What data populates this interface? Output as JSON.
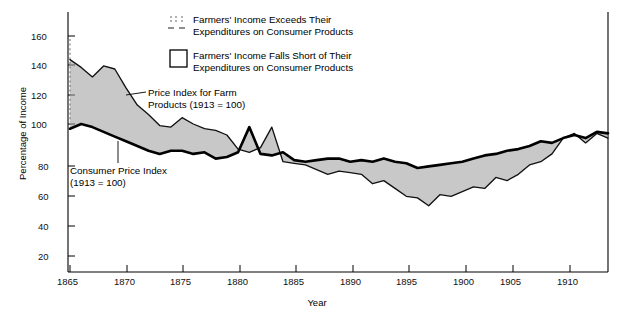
{
  "chart_data": {
    "type": "line",
    "title": "",
    "xlabel": "Year",
    "ylabel": "Percentage of Income",
    "xlim": [
      1865,
      1913
    ],
    "ylim": [
      10,
      170
    ],
    "yticks": [
      20,
      40,
      60,
      80,
      100,
      120,
      140,
      160
    ],
    "xticks": [
      1865,
      1870,
      1875,
      1880,
      1885,
      1890,
      1895,
      1900,
      1905,
      1910
    ],
    "grid": false,
    "legend_position": "top-center",
    "x": [
      1865,
      1866,
      1867,
      1868,
      1869,
      1870,
      1871,
      1872,
      1873,
      1874,
      1875,
      1876,
      1877,
      1878,
      1879,
      1880,
      1881,
      1882,
      1883,
      1884,
      1885,
      1886,
      1887,
      1888,
      1889,
      1890,
      1891,
      1892,
      1893,
      1894,
      1895,
      1896,
      1897,
      1898,
      1899,
      1900,
      1901,
      1902,
      1903,
      1904,
      1905,
      1906,
      1907,
      1908,
      1909,
      1910,
      1911,
      1912,
      1913
    ],
    "series": [
      {
        "name": "Price Index for Farm Products (1913 = 100)",
        "values": [
          145,
          140,
          134,
          141,
          139,
          127,
          116,
          110,
          103,
          102,
          108,
          104,
          101,
          100,
          97,
          88,
          86,
          89,
          102,
          80,
          79,
          78,
          75,
          72,
          74,
          73,
          72,
          66,
          68,
          63,
          58,
          57,
          52,
          59,
          58,
          61,
          64,
          63,
          70,
          68,
          72,
          78,
          80,
          85,
          95,
          98,
          92,
          98,
          95
        ]
      },
      {
        "name": "Consumer Price Index (1913 = 100)",
        "values": [
          101,
          104,
          102,
          99,
          96,
          93,
          90,
          87,
          85,
          87,
          87,
          85,
          86,
          82,
          83,
          86,
          102,
          85,
          84,
          86,
          81,
          80,
          81,
          82,
          82,
          80,
          81,
          80,
          82,
          80,
          79,
          76,
          77,
          78,
          79,
          80,
          82,
          84,
          85,
          87,
          88,
          90,
          93,
          92,
          95,
          97,
          95,
          99,
          98
        ]
      }
    ],
    "annotations": [
      {
        "name": "farm-products-label",
        "text": "Price Index for Farm\nProducts (1913 = 100)"
      },
      {
        "name": "consumer-price-label",
        "text": "Consumer Price Index\n(1913 = 100)"
      }
    ]
  },
  "legend": {
    "items": [
      {
        "swatch": "dashed-band-swatch",
        "line1": "Farmers' Income Exceeds Their",
        "line2": "Expenditures on Consumer Products"
      },
      {
        "swatch": "open-box-swatch",
        "line1": "Farmers' Income Falls Short of Their",
        "line2": "Expenditures on Consumer Products"
      }
    ]
  },
  "axis": {
    "ylabel": "Percentage of Income",
    "xlabel": "Year",
    "yticks": [
      "20",
      "40",
      "60",
      "80",
      "100",
      "120",
      "140",
      "160"
    ],
    "xticks": [
      "1865",
      "1870",
      "1875",
      "1880",
      "1885",
      "1890",
      "1895",
      "1900",
      "1905",
      "1910"
    ]
  },
  "colors": {
    "ink": "#000000",
    "background": "#ffffff",
    "band": "#8a8a8a"
  }
}
